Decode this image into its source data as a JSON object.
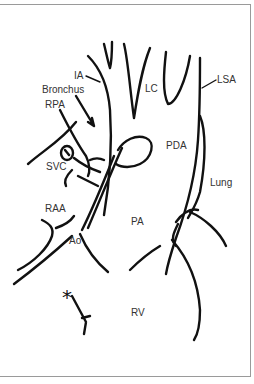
{
  "diagram": {
    "title": "",
    "labels": {
      "ia": "IA",
      "bronchus": "Bronchus",
      "rpa": "RPA",
      "svc": "SVC",
      "raa": "RAA",
      "ao": "Ao",
      "lc": "LC",
      "lsa": "LSA",
      "pda": "PDA",
      "lung": "Lung",
      "pa": "PA",
      "rv": "RV",
      "asterisk": "*"
    },
    "colors": {
      "line": "#111111",
      "label": "#333333",
      "border": "#9a9a9a",
      "background": "#ffffff"
    }
  }
}
